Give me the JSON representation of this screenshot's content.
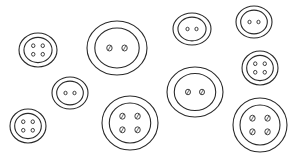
{
  "image": {
    "description": "Line-art illustration of ten sewing buttons scattered on a white background",
    "width": 306,
    "height": 161,
    "background": "#ffffff",
    "stroke_color": "#2a2a2a"
  },
  "buttons": [
    {
      "id": 1,
      "holes": 4,
      "cx": 38,
      "cy": 50,
      "rx": 19,
      "ry": 17
    },
    {
      "id": 2,
      "holes": 2,
      "cx": 117,
      "cy": 48,
      "rx": 30,
      "ry": 27
    },
    {
      "id": 3,
      "holes": 2,
      "cx": 192,
      "cy": 29,
      "rx": 19,
      "ry": 16
    },
    {
      "id": 4,
      "holes": 2,
      "cx": 254,
      "cy": 22,
      "rx": 18,
      "ry": 16
    },
    {
      "id": 5,
      "holes": 4,
      "cx": 260,
      "cy": 68,
      "rx": 18,
      "ry": 17
    },
    {
      "id": 6,
      "holes": 2,
      "cx": 70,
      "cy": 93,
      "rx": 18,
      "ry": 16
    },
    {
      "id": 7,
      "holes": 2,
      "cx": 195,
      "cy": 92,
      "rx": 28,
      "ry": 25
    },
    {
      "id": 8,
      "holes": 4,
      "cx": 130,
      "cy": 123,
      "rx": 28,
      "ry": 27
    },
    {
      "id": 9,
      "holes": 4,
      "cx": 28,
      "cy": 126,
      "rx": 18,
      "ry": 17
    },
    {
      "id": 10,
      "holes": 4,
      "cx": 260,
      "cy": 125,
      "rx": 27,
      "ry": 27
    }
  ]
}
